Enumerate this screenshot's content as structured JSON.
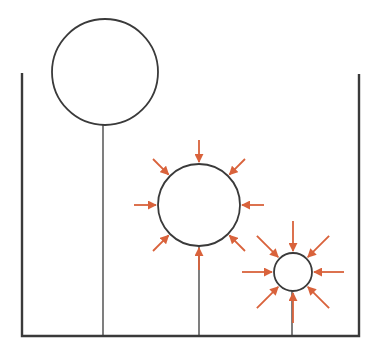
{
  "diagram": {
    "colors": {
      "outline": "#3a3a3a",
      "arrow": "#d9623b",
      "background": "#ffffff"
    },
    "container": {
      "left_x": 22,
      "right_x": 359,
      "left_top_y": 73,
      "right_top_y": 74,
      "bottom_y": 336
    },
    "balloons": [
      {
        "name": "large-balloon",
        "cx": 105,
        "cy": 72,
        "r": 53,
        "string_x": 103,
        "arrows": 0,
        "arrow_len": 0
      },
      {
        "name": "medium-balloon",
        "cx": 199,
        "cy": 205,
        "r": 41,
        "string_x": 199,
        "arrows": 8,
        "arrow_len": 22
      },
      {
        "name": "small-balloon",
        "cx": 293,
        "cy": 272,
        "r": 19,
        "string_x": 292,
        "arrows": 8,
        "arrow_len": 30
      }
    ]
  }
}
